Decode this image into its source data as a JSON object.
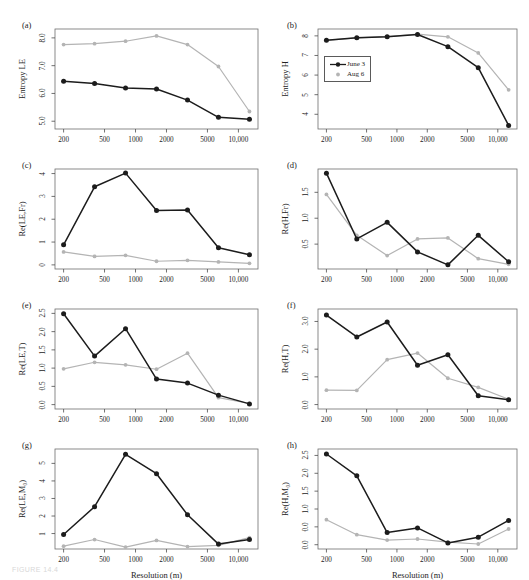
{
  "figure": {
    "caption": "FIGURE 14.4",
    "xlabel": "Resolution (m)",
    "x_ticks": [
      "200",
      "500",
      "1000",
      "2000",
      "5000",
      "10,000"
    ],
    "x_tick_values": [
      200,
      500,
      1000,
      2000,
      5000,
      10000
    ],
    "resolutions": [
      200,
      400,
      800,
      1600,
      3200,
      6400,
      12800
    ],
    "colors": {
      "june": "#1c1c1c",
      "aug": "#b4b4b4",
      "axis": "#4d4d4d",
      "frame": "#6e6e6e"
    }
  },
  "legend": {
    "panel": "b",
    "entries": [
      {
        "label": "June 3",
        "color": "#1c1c1c",
        "marker": "filled-circle-line"
      },
      {
        "label": "Aug 6",
        "color": "#b4b4b4",
        "marker": "filled-circle"
      }
    ]
  },
  "chart_data": [
    {
      "id": "a",
      "type": "line",
      "panel_label": "(a)",
      "ylabel": "Entropy LE",
      "xlabel": "",
      "xlabel_shown": false,
      "xscale": "log",
      "x": [
        200,
        400,
        800,
        1600,
        3200,
        6400,
        12800
      ],
      "ylim": [
        4.72,
        8.32
      ],
      "y_ticks": [
        5.0,
        6.0,
        7.0,
        8.0
      ],
      "y_tick_labels": [
        "5.0",
        "6.0",
        "7.0",
        "8.0"
      ],
      "series": [
        {
          "name": "June 3",
          "color": "#1c1c1c",
          "values": [
            6.44,
            6.36,
            6.2,
            6.16,
            5.76,
            5.14,
            5.07
          ]
        },
        {
          "name": "Aug 6",
          "color": "#b4b4b4",
          "values": [
            7.76,
            7.79,
            7.88,
            8.07,
            7.76,
            6.97,
            5.35
          ]
        }
      ]
    },
    {
      "id": "b",
      "type": "line",
      "panel_label": "(b)",
      "ylabel": "Entropy H",
      "xlabel": "",
      "xlabel_shown": false,
      "xscale": "log",
      "x": [
        200,
        400,
        800,
        1600,
        3200,
        6400,
        12800
      ],
      "ylim": [
        3.25,
        8.35
      ],
      "y_ticks": [
        4,
        5,
        6,
        7,
        8
      ],
      "y_tick_labels": [
        "4",
        "5",
        "6",
        "7",
        "8"
      ],
      "series": [
        {
          "name": "June 3",
          "color": "#1c1c1c",
          "values": [
            7.78,
            7.9,
            7.95,
            8.07,
            7.45,
            6.38,
            3.43
          ]
        },
        {
          "name": "Aug 6",
          "color": "#b4b4b4",
          "values": [
            7.77,
            7.9,
            7.96,
            8.09,
            7.95,
            7.13,
            5.25
          ]
        }
      ]
    },
    {
      "id": "c",
      "type": "line",
      "panel_label": "(c)",
      "ylabel": "Re(LE,Fr)",
      "xlabel": "",
      "xlabel_shown": false,
      "xscale": "log",
      "x": [
        200,
        400,
        800,
        1600,
        3200,
        6400,
        12800
      ],
      "ylim": [
        -0.18,
        4.2
      ],
      "y_ticks": [
        0,
        1,
        2,
        3,
        4
      ],
      "y_tick_labels": [
        "0",
        "1",
        "2",
        "3",
        "4"
      ],
      "series": [
        {
          "name": "June 3",
          "color": "#1c1c1c",
          "values": [
            0.88,
            3.42,
            4.02,
            2.38,
            2.4,
            0.75,
            0.44
          ]
        },
        {
          "name": "Aug 6",
          "color": "#b4b4b4",
          "values": [
            0.57,
            0.37,
            0.42,
            0.16,
            0.2,
            0.13,
            0.07
          ]
        }
      ]
    },
    {
      "id": "d",
      "type": "line",
      "panel_label": "(d)",
      "ylabel": "Re(H,Fr)",
      "xlabel": "",
      "xlabel_shown": false,
      "xscale": "log",
      "x": [
        200,
        400,
        800,
        1600,
        3200,
        6400,
        12800
      ],
      "ylim": [
        0.02,
        1.95
      ],
      "y_ticks": [
        0.5,
        1.0,
        1.5
      ],
      "y_tick_labels": [
        "0.5",
        "1.0",
        "1.5"
      ],
      "series": [
        {
          "name": "June 3",
          "color": "#1c1c1c",
          "values": [
            1.87,
            0.6,
            0.92,
            0.35,
            0.1,
            0.67,
            0.16
          ]
        },
        {
          "name": "Aug 6",
          "color": "#b4b4b4",
          "values": [
            1.46,
            0.67,
            0.28,
            0.6,
            0.62,
            0.22,
            0.11
          ]
        }
      ]
    },
    {
      "id": "e",
      "type": "line",
      "panel_label": "(e)",
      "ylabel": "Re(LE,T)",
      "xlabel": "",
      "xlabel_shown": false,
      "xscale": "log",
      "x": [
        200,
        400,
        800,
        1600,
        3200,
        6400,
        12800
      ],
      "ylim": [
        -0.12,
        2.62
      ],
      "y_ticks": [
        0.0,
        0.5,
        1.0,
        1.5,
        2.0,
        2.5
      ],
      "y_tick_labels": [
        "0.0",
        "0.5",
        "1.0",
        "1.5",
        "2.0",
        "2.5"
      ],
      "series": [
        {
          "name": "June 3",
          "color": "#1c1c1c",
          "values": [
            2.49,
            1.33,
            2.08,
            0.7,
            0.59,
            0.26,
            0.02
          ]
        },
        {
          "name": "Aug 6",
          "color": "#b4b4b4",
          "values": [
            0.98,
            1.16,
            1.09,
            0.97,
            1.41,
            0.19,
            0.03
          ]
        }
      ]
    },
    {
      "id": "f",
      "type": "line",
      "panel_label": "(f)",
      "ylabel": "Re(H,T)",
      "xlabel": "",
      "xlabel_shown": false,
      "xscale": "log",
      "x": [
        200,
        400,
        800,
        1600,
        3200,
        6400,
        12800
      ],
      "ylim": [
        -0.16,
        3.45
      ],
      "y_ticks": [
        0.0,
        1.0,
        2.0,
        3.0
      ],
      "y_tick_labels": [
        "0.0",
        "1.0",
        "2.0",
        "3.0"
      ],
      "series": [
        {
          "name": "June 3",
          "color": "#1c1c1c",
          "values": [
            3.23,
            2.44,
            2.98,
            1.42,
            1.8,
            0.32,
            0.17
          ]
        },
        {
          "name": "Aug 6",
          "color": "#b4b4b4",
          "values": [
            0.52,
            0.51,
            1.62,
            1.86,
            0.95,
            0.62,
            0.19
          ]
        }
      ]
    },
    {
      "id": "g",
      "type": "line",
      "panel_label": "(g)",
      "ylabel": "Re(LE,M₀)",
      "xlabel": "Resolution (m)",
      "xlabel_shown": true,
      "xscale": "log",
      "x": [
        200,
        400,
        800,
        1600,
        3200,
        6400,
        12800
      ],
      "ylim": [
        0.12,
        5.82
      ],
      "y_ticks": [
        1,
        2,
        3,
        4,
        5
      ],
      "y_tick_labels": [
        "1",
        "2",
        "3",
        "4",
        "5"
      ],
      "series": [
        {
          "name": "June 3",
          "color": "#1c1c1c",
          "values": [
            0.95,
            2.53,
            5.52,
            4.41,
            2.07,
            0.4,
            0.66
          ]
        },
        {
          "name": "Aug 6",
          "color": "#b4b4b4",
          "values": [
            0.28,
            0.66,
            0.23,
            0.61,
            0.26,
            0.33,
            0.77
          ]
        }
      ]
    },
    {
      "id": "h",
      "type": "line",
      "panel_label": "(h)",
      "ylabel": "Re(H,M₀)",
      "xlabel": "Resolution (m)",
      "xlabel_shown": true,
      "xscale": "log",
      "x": [
        200,
        400,
        800,
        1600,
        3200,
        6400,
        12800
      ],
      "ylim": [
        -0.12,
        2.68
      ],
      "y_ticks": [
        0.0,
        0.5,
        1.0,
        1.5,
        2.0,
        2.5
      ],
      "y_tick_labels": [
        "0.0",
        "0.0",
        "1.0",
        "1.5",
        "2.0",
        "2.5"
      ],
      "series": [
        {
          "name": "June 3",
          "color": "#1c1c1c",
          "values": [
            2.54,
            1.93,
            0.34,
            0.47,
            0.05,
            0.21,
            0.68
          ]
        },
        {
          "name": "Aug 6",
          "color": "#b4b4b4",
          "values": [
            0.7,
            0.28,
            0.13,
            0.16,
            0.07,
            0.02,
            0.44
          ]
        }
      ]
    }
  ]
}
